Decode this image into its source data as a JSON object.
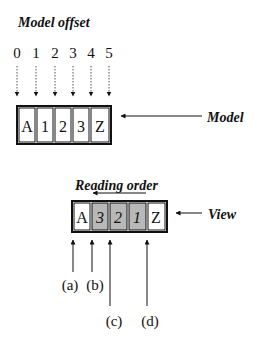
{
  "title": "Model offset",
  "offsets": [
    "0",
    "1",
    "2",
    "3",
    "4",
    "5"
  ],
  "model": {
    "label": "Model",
    "cells": [
      {
        "text": "A",
        "italic": false,
        "shaded": false
      },
      {
        "text": "1",
        "italic": false,
        "shaded": false
      },
      {
        "text": "2",
        "italic": false,
        "shaded": false
      },
      {
        "text": "3",
        "italic": false,
        "shaded": false
      },
      {
        "text": "Z",
        "italic": false,
        "shaded": false
      }
    ]
  },
  "view": {
    "label": "View",
    "reading_order_label": "Reading order",
    "reading_order_direction": "right-to-left",
    "cells": [
      {
        "text": "A",
        "italic": false,
        "shaded": false
      },
      {
        "text": "3",
        "italic": true,
        "shaded": true
      },
      {
        "text": "2",
        "italic": true,
        "shaded": true
      },
      {
        "text": "1",
        "italic": true,
        "shaded": true
      },
      {
        "text": "Z",
        "italic": false,
        "shaded": false
      }
    ]
  },
  "pointers": [
    {
      "label": "(a)"
    },
    {
      "label": "(b)"
    },
    {
      "label": "(c)"
    },
    {
      "label": "(d)"
    }
  ],
  "colors": {
    "ink": "#111111",
    "shade": "#b8b8b8",
    "dotted": "#555555"
  }
}
